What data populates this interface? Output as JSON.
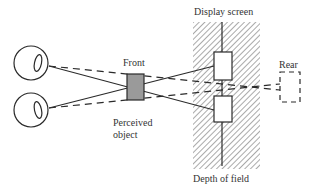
{
  "diagram": {
    "type": "stereoscopic-depth-perception",
    "labels": {
      "display_screen": "Display screen",
      "front": "Front",
      "rear": "Rear",
      "perceived_object_line1": "Perceived",
      "perceived_object_line2": "object",
      "depth_of_field": "Depth of field"
    },
    "elements": {
      "eyes": [
        "left-eye-top",
        "left-eye-bottom"
      ],
      "screen_images": [
        "upper-image",
        "lower-image"
      ],
      "perceived_front_object": "gray box",
      "perceived_rear_object": "dashed box"
    },
    "colors": {
      "line": "#2a2a2a",
      "hatch": "#555555",
      "object_fill": "#9a9a9a",
      "background": "#ffffff"
    }
  }
}
